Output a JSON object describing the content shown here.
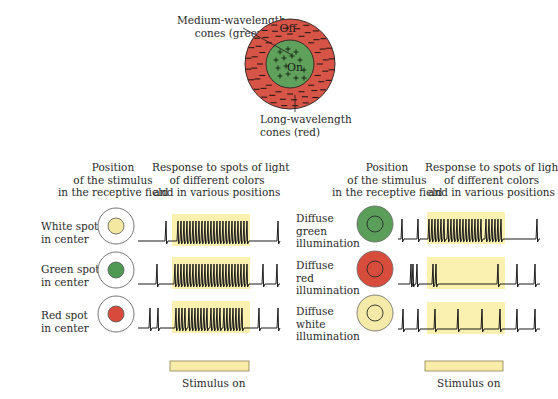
{
  "receptive_field": {
    "surround_label": "Off",
    "center_label": "On",
    "center_sign": "+",
    "surround_sign": "−",
    "center_annotation": [
      "Medium-wavelength",
      "cones (green)"
    ],
    "surround_annotation": [
      "Long-wavelength",
      "cones (red)"
    ],
    "colors": {
      "surround": "#d65547",
      "center": "#5fa05b",
      "outline": "#3a2a2a"
    }
  },
  "left_panel": {
    "header_position": [
      "Position",
      "of the stimulus",
      "in the receptive field"
    ],
    "header_response": [
      "Response to spots of light",
      "of different colors",
      "and in various positions"
    ],
    "rows": [
      {
        "label": [
          "White spot",
          "in center"
        ],
        "spot_color": "#f4e7a0",
        "field_type": "spot"
      },
      {
        "label": [
          "Green spot",
          "in center"
        ],
        "spot_color": "#4e9a52",
        "field_type": "spot"
      },
      {
        "label": [
          "Red spot",
          "in center"
        ],
        "spot_color": "#d84a3a",
        "field_type": "spot"
      }
    ],
    "stimulus_label": "Stimulus on"
  },
  "right_panel": {
    "header_position": [
      "Position",
      "of the stimulus",
      "in the receptive field"
    ],
    "header_response": [
      "Response to spots of light",
      "of different colors",
      "and in various positions"
    ],
    "rows": [
      {
        "label": [
          "Diffuse",
          "green",
          "illumination"
        ],
        "fill_color": "#5a9e5a",
        "field_type": "diffuse"
      },
      {
        "label": [
          "Diffuse",
          "red",
          "illumination"
        ],
        "fill_color": "#d84c3c",
        "field_type": "diffuse"
      },
      {
        "label": [
          "Diffuse",
          "white",
          "illumination"
        ],
        "fill_color": "#f6eaa8",
        "field_type": "diffuse"
      }
    ],
    "stimulus_label": "Stimulus on"
  },
  "colors": {
    "stimulus_highlight": "#faf0b0",
    "stimulus_bar": "#f8eca8",
    "trace": "#1a1a1a"
  },
  "traces": {
    "left": [
      {
        "pre": [
          166
        ],
        "during": [
          178,
          181,
          184,
          187,
          190,
          193,
          196,
          199,
          202,
          205,
          208,
          211,
          214,
          217,
          220,
          223,
          226,
          229,
          232,
          235,
          238,
          241,
          244,
          247
        ],
        "post": [
          278
        ]
      },
      {
        "pre": [
          157
        ],
        "during": [
          175,
          178,
          181,
          184,
          187,
          190,
          193,
          196,
          199,
          202,
          205,
          208,
          211,
          214,
          217,
          220,
          223,
          226,
          229,
          232,
          235,
          238,
          241,
          244,
          247
        ],
        "post": [
          263,
          277
        ]
      },
      {
        "pre": [
          150,
          158
        ],
        "during": [
          176,
          179,
          182,
          185,
          189,
          192,
          195,
          198,
          201,
          204,
          207,
          211,
          214,
          217,
          220,
          224,
          227,
          230,
          233,
          236,
          239,
          242
        ],
        "post": [
          259,
          278
        ]
      }
    ],
    "right": [
      {
        "pre": [
          402,
          418
        ],
        "during": [
          429,
          432,
          435,
          438,
          441,
          444,
          448,
          451,
          454,
          457,
          460,
          463,
          466,
          469,
          472,
          475,
          478,
          481,
          486,
          489,
          492,
          495,
          498,
          501
        ],
        "post": [
          537
        ]
      },
      {
        "pre": [
          411,
          413,
          417
        ],
        "during": [
          433,
          436,
          498
        ],
        "post": [
          517,
          535
        ]
      },
      {
        "pre": [
          403,
          418
        ],
        "during": [
          435,
          458,
          482,
          500
        ],
        "post": [
          517,
          535
        ]
      }
    ]
  }
}
